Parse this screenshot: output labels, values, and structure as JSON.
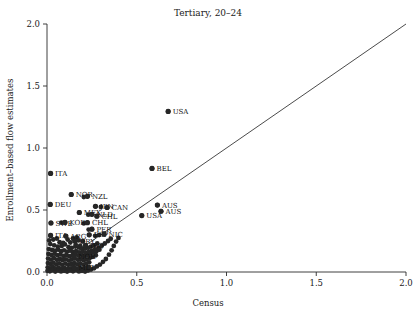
{
  "chart_data": {
    "type": "scatter",
    "title": "Tertiary, 20–24",
    "xlabel": "Census",
    "ylabel": "Enrollment–based flow estimates",
    "xlim": [
      0.0,
      2.0
    ],
    "ylim": [
      0.0,
      2.0
    ],
    "xticks": [
      "0.0",
      "0.5",
      "1.0",
      "1.5",
      "2.0"
    ],
    "xtick_values": [
      0.0,
      0.5,
      1.0,
      1.5,
      2.0
    ],
    "yticks": [
      "0.0",
      "0.5",
      "1.0",
      "1.5",
      "2.0"
    ],
    "ytick_values": [
      0.0,
      0.5,
      1.0,
      1.5,
      2.0
    ],
    "grid": false,
    "legend": "none",
    "reference_line": {
      "name": "45-degree identity line",
      "from": [
        0.0,
        0.0
      ],
      "to": [
        2.0,
        2.0
      ]
    },
    "labeled_points": [
      {
        "label": "USA",
        "x": 0.675,
        "y": 1.295,
        "label_side": "right"
      },
      {
        "label": "BEL",
        "x": 0.585,
        "y": 0.835,
        "label_side": "right"
      },
      {
        "label": "ITA",
        "x": 0.02,
        "y": 0.795,
        "label_side": "right"
      },
      {
        "label": "NOR",
        "x": 0.135,
        "y": 0.625,
        "label_side": "right"
      },
      {
        "label": "NZL",
        "x": 0.225,
        "y": 0.61,
        "label_side": "right"
      },
      {
        "label": "DEU",
        "x": 0.018,
        "y": 0.545,
        "label_side": "right"
      },
      {
        "label": "AUS",
        "x": 0.615,
        "y": 0.54,
        "label_side": "right"
      },
      {
        "label": "JPN",
        "x": 0.27,
        "y": 0.53,
        "label_side": "right"
      },
      {
        "label": "CAN",
        "x": 0.335,
        "y": 0.52,
        "label_side": "right"
      },
      {
        "label": "AUS",
        "x": 0.635,
        "y": 0.49,
        "label_side": "right"
      },
      {
        "label": "MEX",
        "x": 0.18,
        "y": 0.48,
        "label_side": "right"
      },
      {
        "label": "NLD",
        "x": 0.25,
        "y": 0.465,
        "label_side": "right"
      },
      {
        "label": "CHL",
        "x": 0.278,
        "y": 0.45,
        "label_side": "right"
      },
      {
        "label": "USA",
        "x": 0.528,
        "y": 0.455,
        "label_side": "right"
      },
      {
        "label": "SWE",
        "x": 0.022,
        "y": 0.395,
        "label_side": "right"
      },
      {
        "label": "KOR",
        "x": 0.1,
        "y": 0.4,
        "label_side": "right"
      },
      {
        "label": "CHL",
        "x": 0.225,
        "y": 0.398,
        "label_side": "right"
      },
      {
        "label": "PER",
        "x": 0.25,
        "y": 0.345,
        "label_side": "right"
      },
      {
        "label": "ITA",
        "x": 0.02,
        "y": 0.295,
        "label_side": "right"
      },
      {
        "label": "ARG",
        "x": 0.105,
        "y": 0.29,
        "label_side": "right"
      },
      {
        "label": "ESP",
        "x": 0.235,
        "y": 0.3,
        "label_side": "right"
      },
      {
        "label": "NIC",
        "x": 0.318,
        "y": 0.305,
        "label_side": "right"
      },
      {
        "label": "URY",
        "x": 0.155,
        "y": 0.25,
        "label_side": "right"
      },
      {
        "label": "IRQ",
        "x": 0.215,
        "y": 0.215,
        "label_side": "right"
      },
      {
        "label": "NOR",
        "x": 0.15,
        "y": 0.125,
        "label_side": "right"
      },
      {
        "label": "MLT",
        "x": 0.15,
        "y": 0.035,
        "label_side": "right"
      }
    ],
    "points": [
      {
        "x": 0.675,
        "y": 1.295
      },
      {
        "x": 0.585,
        "y": 0.835
      },
      {
        "x": 0.02,
        "y": 0.795
      },
      {
        "x": 0.135,
        "y": 0.625
      },
      {
        "x": 0.225,
        "y": 0.61
      },
      {
        "x": 0.205,
        "y": 0.605
      },
      {
        "x": 0.018,
        "y": 0.545
      },
      {
        "x": 0.615,
        "y": 0.54
      },
      {
        "x": 0.27,
        "y": 0.53
      },
      {
        "x": 0.3,
        "y": 0.525
      },
      {
        "x": 0.335,
        "y": 0.52
      },
      {
        "x": 0.635,
        "y": 0.49
      },
      {
        "x": 0.18,
        "y": 0.48
      },
      {
        "x": 0.25,
        "y": 0.465
      },
      {
        "x": 0.23,
        "y": 0.462
      },
      {
        "x": 0.278,
        "y": 0.45
      },
      {
        "x": 0.528,
        "y": 0.455
      },
      {
        "x": 0.022,
        "y": 0.395
      },
      {
        "x": 0.1,
        "y": 0.4
      },
      {
        "x": 0.08,
        "y": 0.398
      },
      {
        "x": 0.225,
        "y": 0.398
      },
      {
        "x": 0.205,
        "y": 0.392
      },
      {
        "x": 0.25,
        "y": 0.345
      },
      {
        "x": 0.232,
        "y": 0.342
      },
      {
        "x": 0.02,
        "y": 0.295
      },
      {
        "x": 0.105,
        "y": 0.29
      },
      {
        "x": 0.235,
        "y": 0.3
      },
      {
        "x": 0.318,
        "y": 0.305
      },
      {
        "x": 0.29,
        "y": 0.298
      },
      {
        "x": 0.268,
        "y": 0.292
      },
      {
        "x": 0.155,
        "y": 0.25
      },
      {
        "x": 0.175,
        "y": 0.255
      },
      {
        "x": 0.2,
        "y": 0.248
      },
      {
        "x": 0.215,
        "y": 0.215
      },
      {
        "x": 0.185,
        "y": 0.212
      },
      {
        "x": 0.16,
        "y": 0.22
      },
      {
        "x": 0.15,
        "y": 0.125
      },
      {
        "x": 0.15,
        "y": 0.035
      },
      {
        "x": 0.012,
        "y": 0.255
      },
      {
        "x": 0.035,
        "y": 0.262
      },
      {
        "x": 0.055,
        "y": 0.27
      },
      {
        "x": 0.07,
        "y": 0.24
      },
      {
        "x": 0.09,
        "y": 0.235
      },
      {
        "x": 0.115,
        "y": 0.262
      },
      {
        "x": 0.13,
        "y": 0.238
      },
      {
        "x": 0.145,
        "y": 0.27
      },
      {
        "x": 0.165,
        "y": 0.28
      },
      {
        "x": 0.018,
        "y": 0.225
      },
      {
        "x": 0.04,
        "y": 0.215
      },
      {
        "x": 0.06,
        "y": 0.205
      },
      {
        "x": 0.082,
        "y": 0.21
      },
      {
        "x": 0.1,
        "y": 0.222
      },
      {
        "x": 0.12,
        "y": 0.2
      },
      {
        "x": 0.138,
        "y": 0.195
      },
      {
        "x": 0.158,
        "y": 0.205
      },
      {
        "x": 0.178,
        "y": 0.198
      },
      {
        "x": 0.195,
        "y": 0.19
      },
      {
        "x": 0.212,
        "y": 0.188
      },
      {
        "x": 0.23,
        "y": 0.195
      },
      {
        "x": 0.245,
        "y": 0.205
      },
      {
        "x": 0.262,
        "y": 0.215
      },
      {
        "x": 0.28,
        "y": 0.23
      },
      {
        "x": 0.01,
        "y": 0.185
      },
      {
        "x": 0.028,
        "y": 0.178
      },
      {
        "x": 0.045,
        "y": 0.172
      },
      {
        "x": 0.062,
        "y": 0.18
      },
      {
        "x": 0.078,
        "y": 0.168
      },
      {
        "x": 0.095,
        "y": 0.175
      },
      {
        "x": 0.112,
        "y": 0.165
      },
      {
        "x": 0.128,
        "y": 0.172
      },
      {
        "x": 0.145,
        "y": 0.16
      },
      {
        "x": 0.162,
        "y": 0.168
      },
      {
        "x": 0.18,
        "y": 0.158
      },
      {
        "x": 0.198,
        "y": 0.165
      },
      {
        "x": 0.215,
        "y": 0.155
      },
      {
        "x": 0.232,
        "y": 0.162
      },
      {
        "x": 0.25,
        "y": 0.172
      },
      {
        "x": 0.268,
        "y": 0.182
      },
      {
        "x": 0.288,
        "y": 0.195
      },
      {
        "x": 0.305,
        "y": 0.212
      },
      {
        "x": 0.322,
        "y": 0.23
      },
      {
        "x": 0.34,
        "y": 0.25
      },
      {
        "x": 0.355,
        "y": 0.268
      },
      {
        "x": 0.008,
        "y": 0.145
      },
      {
        "x": 0.025,
        "y": 0.138
      },
      {
        "x": 0.042,
        "y": 0.148
      },
      {
        "x": 0.058,
        "y": 0.135
      },
      {
        "x": 0.075,
        "y": 0.142
      },
      {
        "x": 0.092,
        "y": 0.13
      },
      {
        "x": 0.108,
        "y": 0.138
      },
      {
        "x": 0.125,
        "y": 0.128
      },
      {
        "x": 0.142,
        "y": 0.135
      },
      {
        "x": 0.158,
        "y": 0.145
      },
      {
        "x": 0.175,
        "y": 0.132
      },
      {
        "x": 0.192,
        "y": 0.14
      },
      {
        "x": 0.208,
        "y": 0.13
      },
      {
        "x": 0.225,
        "y": 0.138
      },
      {
        "x": 0.242,
        "y": 0.148
      },
      {
        "x": 0.258,
        "y": 0.158
      },
      {
        "x": 0.275,
        "y": 0.168
      },
      {
        "x": 0.292,
        "y": 0.18
      },
      {
        "x": 0.006,
        "y": 0.108
      },
      {
        "x": 0.022,
        "y": 0.1
      },
      {
        "x": 0.038,
        "y": 0.112
      },
      {
        "x": 0.055,
        "y": 0.098
      },
      {
        "x": 0.072,
        "y": 0.105
      },
      {
        "x": 0.088,
        "y": 0.095
      },
      {
        "x": 0.105,
        "y": 0.102
      },
      {
        "x": 0.122,
        "y": 0.092
      },
      {
        "x": 0.138,
        "y": 0.1
      },
      {
        "x": 0.155,
        "y": 0.108
      },
      {
        "x": 0.172,
        "y": 0.098
      },
      {
        "x": 0.188,
        "y": 0.105
      },
      {
        "x": 0.205,
        "y": 0.095
      },
      {
        "x": 0.222,
        "y": 0.102
      },
      {
        "x": 0.238,
        "y": 0.112
      },
      {
        "x": 0.255,
        "y": 0.122
      },
      {
        "x": 0.272,
        "y": 0.135
      },
      {
        "x": 0.005,
        "y": 0.072
      },
      {
        "x": 0.02,
        "y": 0.065
      },
      {
        "x": 0.035,
        "y": 0.075
      },
      {
        "x": 0.052,
        "y": 0.062
      },
      {
        "x": 0.068,
        "y": 0.07
      },
      {
        "x": 0.085,
        "y": 0.058
      },
      {
        "x": 0.102,
        "y": 0.068
      },
      {
        "x": 0.118,
        "y": 0.058
      },
      {
        "x": 0.135,
        "y": 0.065
      },
      {
        "x": 0.152,
        "y": 0.072
      },
      {
        "x": 0.168,
        "y": 0.062
      },
      {
        "x": 0.185,
        "y": 0.07
      },
      {
        "x": 0.202,
        "y": 0.06
      },
      {
        "x": 0.218,
        "y": 0.068
      },
      {
        "x": 0.235,
        "y": 0.078
      },
      {
        "x": 0.004,
        "y": 0.038
      },
      {
        "x": 0.018,
        "y": 0.03
      },
      {
        "x": 0.032,
        "y": 0.042
      },
      {
        "x": 0.048,
        "y": 0.028
      },
      {
        "x": 0.065,
        "y": 0.035
      },
      {
        "x": 0.082,
        "y": 0.025
      },
      {
        "x": 0.098,
        "y": 0.032
      },
      {
        "x": 0.115,
        "y": 0.022
      },
      {
        "x": 0.132,
        "y": 0.03
      },
      {
        "x": 0.148,
        "y": 0.038
      },
      {
        "x": 0.165,
        "y": 0.028
      },
      {
        "x": 0.182,
        "y": 0.035
      },
      {
        "x": 0.198,
        "y": 0.025
      },
      {
        "x": 0.215,
        "y": 0.032
      },
      {
        "x": 0.232,
        "y": 0.042
      },
      {
        "x": 0.003,
        "y": 0.01
      },
      {
        "x": 0.016,
        "y": 0.006
      },
      {
        "x": 0.03,
        "y": 0.014
      },
      {
        "x": 0.046,
        "y": 0.004
      },
      {
        "x": 0.062,
        "y": 0.012
      },
      {
        "x": 0.078,
        "y": 0.005
      },
      {
        "x": 0.095,
        "y": 0.01
      },
      {
        "x": 0.112,
        "y": 0.004
      },
      {
        "x": 0.128,
        "y": 0.012
      },
      {
        "x": 0.145,
        "y": 0.006
      },
      {
        "x": 0.162,
        "y": 0.014
      },
      {
        "x": 0.178,
        "y": 0.005
      },
      {
        "x": 0.195,
        "y": 0.01
      },
      {
        "x": 0.212,
        "y": 0.004
      },
      {
        "x": 0.228,
        "y": 0.012
      },
      {
        "x": 0.245,
        "y": 0.02
      },
      {
        "x": 0.262,
        "y": 0.03
      },
      {
        "x": 0.278,
        "y": 0.045
      },
      {
        "x": 0.295,
        "y": 0.06
      },
      {
        "x": 0.312,
        "y": 0.082
      },
      {
        "x": 0.328,
        "y": 0.105
      },
      {
        "x": 0.345,
        "y": 0.14
      },
      {
        "x": 0.36,
        "y": 0.175
      },
      {
        "x": 0.372,
        "y": 0.21
      },
      {
        "x": 0.385,
        "y": 0.245
      },
      {
        "x": 0.398,
        "y": 0.275
      }
    ]
  }
}
